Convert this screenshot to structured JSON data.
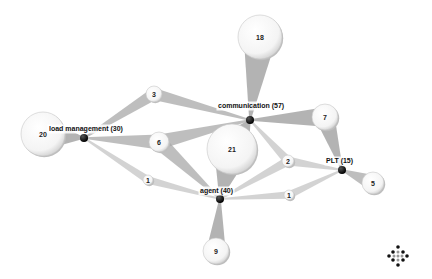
{
  "diagram": {
    "hubs": [
      {
        "id": "communication",
        "label": "communication (57)",
        "x": 250,
        "y": 120,
        "lx": 218,
        "ly": 108
      },
      {
        "id": "load_management",
        "label": "load management (30)",
        "x": 84,
        "y": 138,
        "lx": 49,
        "ly": 131
      },
      {
        "id": "agent",
        "label": "agent (40)",
        "x": 220,
        "y": 199,
        "lx": 200,
        "ly": 193
      },
      {
        "id": "plt",
        "label": "PLT (15)",
        "x": 342,
        "y": 170,
        "lx": 326,
        "ly": 163
      }
    ],
    "bubbles": [
      {
        "value": "18",
        "x": 260,
        "y": 37,
        "r": 22,
        "links": [
          "communication"
        ]
      },
      {
        "value": "20",
        "x": 43,
        "y": 134,
        "r": 22,
        "links": [
          "load_management"
        ]
      },
      {
        "value": "9",
        "x": 216,
        "y": 251,
        "r": 13,
        "links": [
          "agent"
        ]
      },
      {
        "value": "5",
        "x": 373,
        "y": 183,
        "r": 11,
        "links": [
          "plt"
        ]
      },
      {
        "value": "7",
        "x": 325,
        "y": 117,
        "r": 13,
        "links": [
          "communication",
          "plt"
        ]
      },
      {
        "value": "21",
        "x": 232,
        "y": 149,
        "r": 25,
        "links": [
          "communication",
          "agent"
        ]
      },
      {
        "value": "3",
        "x": 154,
        "y": 94,
        "r": 8,
        "links": [
          "communication",
          "load_management"
        ]
      },
      {
        "value": "6",
        "x": 159,
        "y": 142,
        "r": 10,
        "links": [
          "communication",
          "load_management",
          "agent"
        ]
      },
      {
        "value": "2",
        "x": 288,
        "y": 161,
        "r": 6,
        "links": [
          "communication",
          "agent",
          "plt"
        ]
      },
      {
        "value": "1",
        "x": 148,
        "y": 180,
        "r": 5,
        "links": [
          "load_management",
          "agent"
        ]
      },
      {
        "value": "1",
        "x": 289,
        "y": 195,
        "r": 5,
        "links": [
          "agent",
          "plt"
        ]
      }
    ]
  },
  "brand": {
    "name": "aidministrator"
  }
}
